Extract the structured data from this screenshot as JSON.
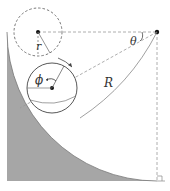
{
  "diagram": {
    "labels": {
      "small_radius": "r",
      "large_radius": "R",
      "track_angle": "θ",
      "rotation_angle": "ϕ"
    },
    "colors": {
      "fill": "#a6a6a6",
      "line": "#555555",
      "dashed": "#999999",
      "point": "#111111"
    }
  }
}
